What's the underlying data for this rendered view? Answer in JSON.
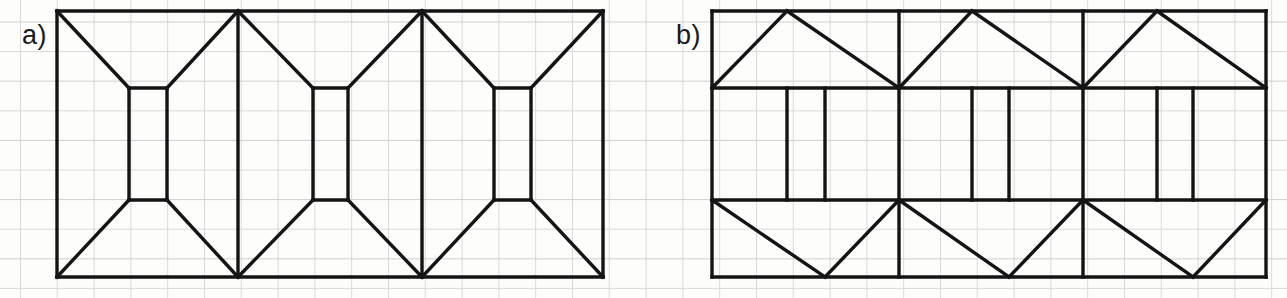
{
  "page": {
    "background_color": "#fdfdfb",
    "width": 1287,
    "height": 298
  },
  "grid": {
    "line_color": "#d9d9d9",
    "line_color_strong": "#cfcfcf",
    "cell_width": 36.8,
    "cell_height": 29.6,
    "origin_x": 20.5,
    "origin_y": 22.0,
    "stroke_width": 1
  },
  "ink": {
    "color": "#141414",
    "stroke_width": 3.4,
    "stroke_width_thin": 2.8
  },
  "figures": [
    {
      "id": "figure-a",
      "label": "a)",
      "label_x": 22,
      "label_y": 22,
      "description": "Hexagonal bowtie band: three bowtie/hourglass modules in a row inside a rectangle, with small inner rectangles at the waists",
      "frame": {
        "left": 57,
        "top": 11,
        "right": 603,
        "bottom": 277
      },
      "waist_top": 88,
      "waist_bottom": 200,
      "x_stops": [
        57,
        129,
        167,
        238,
        313,
        348,
        422,
        494,
        531,
        603
      ],
      "polylines": [
        "57,11 603,11",
        "57,277 603,277",
        "57,11 57,277",
        "603,11 603,277",
        "238,11 238,277",
        "422,11 422,277",
        "57,11 129,88",
        "238,11 167,88",
        "129,88 167,88",
        "129,88 129,200",
        "167,88 167,200",
        "129,200 167,200",
        "57,277 129,200",
        "238,277 167,200",
        "238,11 313,88",
        "422,11 348,88",
        "313,88 348,88",
        "313,88 313,200",
        "348,88 348,200",
        "313,200 348,200",
        "238,277 313,200",
        "422,277 348,200",
        "422,11 494,88",
        "603,11 531,88",
        "494,88 531,88",
        "494,88 494,200",
        "531,88 531,200",
        "494,200 531,200",
        "422,277 494,200",
        "603,277 531,200"
      ]
    },
    {
      "id": "figure-b",
      "label": "b)",
      "label_x": 676,
      "label_y": 22,
      "description": "Zig-zag band: three modules with upward triangles on top, downward triangles on bottom, and paired vertical lines in the middle band",
      "frame": {
        "left": 712,
        "top": 11,
        "right": 1266,
        "bottom": 277
      },
      "band_top": 88,
      "band_bottom": 200,
      "x_stops": [
        712,
        787,
        825,
        899,
        972,
        1009,
        1083,
        1157,
        1193,
        1266
      ],
      "polylines": [
        "712,11 1266,11",
        "712,277 1266,277",
        "712,11 712,277",
        "1266,11 1266,277",
        "899,11 899,277",
        "1083,11 1083,277",
        "712,88 1266,88",
        "712,200 1266,200",
        "712,88 787,11",
        "787,11 899,88",
        "899,88 972,11",
        "972,11 1083,88",
        "1083,88 1157,11",
        "1157,11 1266,88",
        "712,200 825,277",
        "825,277 899,200",
        "899,200 1009,277",
        "1009,277 1083,200",
        "1083,200 1193,277",
        "1193,277 1266,200",
        "787,88 787,200",
        "825,88 825,200",
        "972,88 972,200",
        "1009,88 1009,200",
        "1157,88 1157,200",
        "1193,88 1193,200"
      ]
    }
  ]
}
